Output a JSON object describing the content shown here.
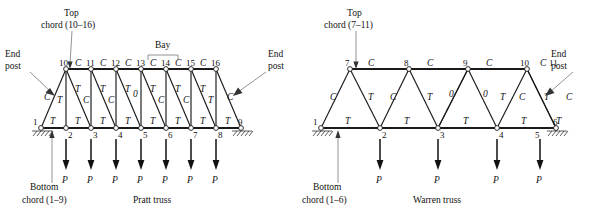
{
  "figure": {
    "title": "",
    "background": "#ffffff",
    "line_color": "#1a1a1a",
    "leader_color": "#777777"
  },
  "annotations": {
    "bay_label": "Bay",
    "end_post_label_line1": "End",
    "end_post_label_line2": "post",
    "load_symbol": "P",
    "tension_symbol": "T",
    "compression_symbol": "C",
    "zero_symbol": "0"
  },
  "left_truss": {
    "name": "Pratt truss",
    "caption": "Pratt truss",
    "top_chord_label_line1": "Top",
    "top_chord_label_line2": "chord (10–16)",
    "bottom_chord_label_line1": "Bottom",
    "bottom_chord_label_line2": "chord (1–9)",
    "end_post_left_line1": "End",
    "end_post_left_line2": "post",
    "end_post_right_line1": "End",
    "end_post_right_line2": "post",
    "bay_label": "Bay",
    "bottom_nodes": [
      "1",
      "2",
      "3",
      "4",
      "5",
      "6",
      "7",
      "8",
      "9"
    ],
    "top_nodes": [
      "10",
      "11",
      "12",
      "13",
      "14",
      "15",
      "16"
    ],
    "loads": [
      "P",
      "P",
      "P",
      "P",
      "P",
      "P",
      "P"
    ],
    "load_nodes": [
      "2",
      "3",
      "4",
      "5",
      "6",
      "7",
      "8"
    ],
    "top_chord_forces": [
      "C",
      "C",
      "C",
      "C",
      "C",
      "C"
    ],
    "bottom_chord_forces": [
      "T",
      "T",
      "T",
      "T",
      "T",
      "T",
      "T",
      "T"
    ],
    "vertical_forces": [
      "T",
      "C",
      "C",
      "0",
      "C",
      "C",
      "T"
    ],
    "diagonal_forces": [
      "C",
      "T",
      "T",
      "T",
      "T",
      "T",
      "T",
      "C"
    ],
    "end_post_force_left": "C",
    "end_post_force_right": "C",
    "center_vertical_force": "0"
  },
  "right_truss": {
    "name": "Warren truss",
    "caption": "Warren truss",
    "top_chord_label_line1": "Top",
    "top_chord_label_line2": "chord (7–11)",
    "bottom_chord_label_line1": "Bottom",
    "bottom_chord_label_line2": "chord (1–6)",
    "end_post_right_line1": "End",
    "end_post_right_line2": "post",
    "bottom_nodes": [
      "1",
      "2",
      "3",
      "4",
      "5",
      "6"
    ],
    "top_nodes": [
      "7",
      "8",
      "9",
      "10",
      "11"
    ],
    "loads": [
      "P",
      "P",
      "P",
      "P"
    ],
    "load_nodes": [
      "2",
      "3",
      "4",
      "5"
    ],
    "top_chord_forces": [
      "C",
      "C",
      "C",
      "C"
    ],
    "bottom_chord_forces": [
      "T",
      "T",
      "T",
      "T",
      "T"
    ],
    "diagonal_forces": [
      "C",
      "T",
      "C",
      "T",
      "0",
      "0",
      "T",
      "C",
      "T",
      "C"
    ],
    "end_post_force_left": "C",
    "end_post_force_right": "C"
  }
}
